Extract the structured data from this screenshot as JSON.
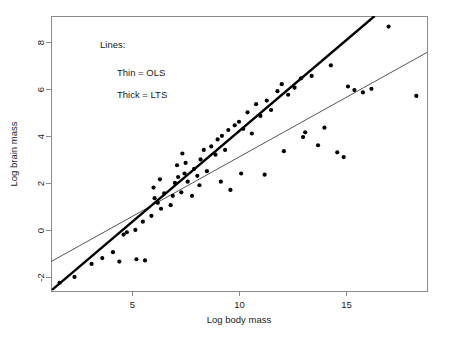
{
  "chart_data": {
    "type": "scatter",
    "title": "",
    "xlabel": "Log body mass",
    "ylabel": "Log brain mass",
    "xlim": [
      1.2,
      18.8
    ],
    "ylim": [
      -2.6,
      9.1
    ],
    "xticks": [
      5,
      10,
      15
    ],
    "xtick_labels": [
      "5",
      "10",
      "15"
    ],
    "yticks": [
      -2,
      0,
      2,
      4,
      6,
      8
    ],
    "ytick_labels": [
      "-2",
      "0",
      "2",
      "4",
      "6",
      "8"
    ],
    "grid": false,
    "legend_position": "upper-left",
    "annotations": [
      "Lines:",
      "Thin = OLS",
      "Thick = LTS"
    ],
    "points": [
      [
        1.6,
        -2.25
      ],
      [
        2.3,
        -2.0
      ],
      [
        3.1,
        -1.45
      ],
      [
        3.6,
        -1.2
      ],
      [
        4.1,
        -0.95
      ],
      [
        4.4,
        -1.35
      ],
      [
        4.6,
        -0.2
      ],
      [
        4.75,
        -0.1
      ],
      [
        5.2,
        -1.25
      ],
      [
        5.6,
        -1.3
      ],
      [
        5.15,
        0.0
      ],
      [
        5.5,
        0.35
      ],
      [
        5.9,
        0.6
      ],
      [
        6.2,
        1.15
      ],
      [
        6.35,
        0.9
      ],
      [
        6.05,
        1.35
      ],
      [
        6.5,
        1.55
      ],
      [
        6.3,
        2.15
      ],
      [
        6.0,
        1.8
      ],
      [
        6.8,
        1.05
      ],
      [
        6.9,
        1.45
      ],
      [
        7.0,
        2.0
      ],
      [
        7.15,
        2.25
      ],
      [
        7.3,
        1.6
      ],
      [
        7.45,
        2.4
      ],
      [
        7.1,
        2.75
      ],
      [
        7.5,
        2.85
      ],
      [
        7.35,
        3.25
      ],
      [
        7.6,
        2.05
      ],
      [
        7.8,
        1.45
      ],
      [
        7.9,
        2.6
      ],
      [
        8.05,
        2.3
      ],
      [
        8.2,
        3.0
      ],
      [
        8.35,
        3.4
      ],
      [
        8.15,
        1.9
      ],
      [
        8.5,
        2.5
      ],
      [
        8.7,
        3.55
      ],
      [
        8.9,
        3.2
      ],
      [
        9.0,
        3.85
      ],
      [
        9.2,
        4.0
      ],
      [
        9.35,
        3.4
      ],
      [
        9.5,
        4.25
      ],
      [
        9.15,
        2.05
      ],
      [
        9.6,
        1.7
      ],
      [
        9.8,
        4.45
      ],
      [
        10.0,
        4.6
      ],
      [
        10.2,
        4.3
      ],
      [
        10.4,
        5.0
      ],
      [
        10.1,
        2.4
      ],
      [
        10.6,
        4.1
      ],
      [
        10.8,
        5.35
      ],
      [
        11.0,
        4.85
      ],
      [
        11.3,
        5.5
      ],
      [
        11.5,
        5.1
      ],
      [
        11.2,
        2.35
      ],
      [
        11.8,
        5.9
      ],
      [
        12.0,
        6.2
      ],
      [
        12.3,
        5.75
      ],
      [
        12.1,
        3.35
      ],
      [
        12.6,
        6.05
      ],
      [
        12.9,
        6.45
      ],
      [
        13.1,
        4.15
      ],
      [
        13.4,
        6.55
      ],
      [
        13.0,
        3.95
      ],
      [
        13.7,
        3.6
      ],
      [
        14.0,
        4.35
      ],
      [
        14.3,
        7.0
      ],
      [
        14.6,
        3.3
      ],
      [
        14.9,
        3.1
      ],
      [
        15.1,
        6.1
      ],
      [
        15.4,
        5.95
      ],
      [
        15.8,
        5.85
      ],
      [
        16.2,
        6.0
      ],
      [
        17.0,
        8.65
      ],
      [
        18.3,
        5.7
      ]
    ],
    "series": [
      {
        "name": "Thin = OLS",
        "type": "line",
        "style": "thin",
        "color": "#555555",
        "endpoints": [
          [
            1.2,
            -1.35
          ],
          [
            18.8,
            7.55
          ]
        ]
      },
      {
        "name": "Thick = LTS",
        "type": "line",
        "style": "thick",
        "color": "#000000",
        "endpoints": [
          [
            1.25,
            -2.55
          ],
          [
            16.35,
            9.1
          ]
        ]
      }
    ]
  }
}
